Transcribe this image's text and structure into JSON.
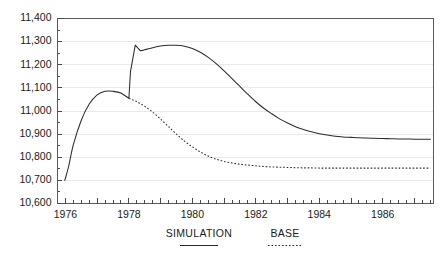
{
  "chart_data": {
    "type": "line",
    "title": "",
    "subtitle": "",
    "xlabel": "",
    "ylabel": "",
    "xlim": [
      1975.75,
      1987.6
    ],
    "ylim": [
      10600,
      11400
    ],
    "grid": true,
    "legend_position": "bottom",
    "y_ticks": [
      10600,
      10700,
      10800,
      10900,
      11000,
      11100,
      11200,
      11300,
      11400
    ],
    "y_tick_labels": [
      "10,600",
      "10,700",
      "10,800",
      "10,900",
      "11,000",
      "11,100",
      "11,200",
      "11,300",
      "11,400"
    ],
    "x_ticks": [
      1976,
      1978,
      1980,
      1982,
      1984,
      1986
    ],
    "x_tick_labels": [
      "1976",
      "1978",
      "1980",
      "1982",
      "1984",
      "1986"
    ],
    "x_minor_tick_step": 0.25,
    "series": [
      {
        "name": "SIMULATION",
        "style": "solid",
        "x": [
          1975.98,
          1976.1,
          1976.25,
          1976.5,
          1976.75,
          1977.0,
          1977.25,
          1977.5,
          1977.75,
          1978.0,
          1978.05,
          1978.2,
          1978.35,
          1978.5,
          1978.75,
          1979.0,
          1979.25,
          1979.5,
          1979.75,
          1980.0,
          1980.25,
          1980.5,
          1980.75,
          1981.0,
          1981.25,
          1981.5,
          1981.75,
          1982.0,
          1982.25,
          1982.5,
          1982.75,
          1983.0,
          1983.25,
          1983.5,
          1983.75,
          1984.0,
          1984.25,
          1984.5,
          1984.75,
          1985.0,
          1985.25,
          1985.5,
          1985.75,
          1986.0,
          1986.25,
          1986.5,
          1986.75,
          1987.0,
          1987.25,
          1987.5
        ],
        "y": [
          10700,
          10760,
          10855,
          10960,
          11030,
          11070,
          11085,
          11085,
          11078,
          11055,
          11170,
          11285,
          11262,
          11265,
          11274,
          11281,
          11284,
          11284,
          11280,
          11270,
          11254,
          11232,
          11205,
          11174,
          11140,
          11106,
          11072,
          11040,
          11012,
          10988,
          10966,
          10948,
          10932,
          10920,
          10910,
          10902,
          10896,
          10891,
          10888,
          10886,
          10884,
          10883,
          10882,
          10881,
          10880,
          10879,
          10879,
          10878,
          10878,
          10878
        ]
      },
      {
        "name": "BASE",
        "style": "dotted",
        "x": [
          1978.0,
          1978.25,
          1978.5,
          1978.75,
          1979.0,
          1979.25,
          1979.5,
          1979.75,
          1980.0,
          1980.25,
          1980.5,
          1980.75,
          1981.0,
          1981.25,
          1981.5,
          1981.75,
          1982.0,
          1982.25,
          1982.5,
          1982.75,
          1983.0,
          1983.25,
          1983.5,
          1983.75,
          1984.0,
          1984.25,
          1984.5,
          1984.75,
          1985.0,
          1985.25,
          1985.5,
          1985.75,
          1986.0,
          1986.25,
          1986.5,
          1986.75,
          1987.0,
          1987.25,
          1987.5
        ],
        "y": [
          11055,
          11040,
          11020,
          10995,
          10965,
          10932,
          10900,
          10870,
          10845,
          10823,
          10805,
          10792,
          10782,
          10775,
          10770,
          10766,
          10763,
          10760,
          10758,
          10757,
          10756,
          10755,
          10754,
          10754,
          10753,
          10753,
          10753,
          10753,
          10753,
          10753,
          10753,
          10753,
          10753,
          10753,
          10753,
          10753,
          10753,
          10753,
          10753
        ]
      }
    ],
    "legend_entries": [
      {
        "label": "SIMULATION",
        "style": "solid"
      },
      {
        "label": "BASE",
        "style": "dotted"
      }
    ],
    "colors": {
      "line": "#2b2b2b",
      "grid": "#e9e9e9",
      "axis": "#5a5a5a",
      "text": "#1a1a1a",
      "background": "#ffffff"
    }
  }
}
